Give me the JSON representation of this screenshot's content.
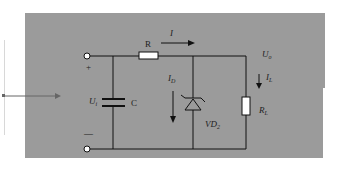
{
  "diagram": {
    "background_color": "#9a9a9a",
    "labels": {
      "resistor": "R",
      "current_main": "I",
      "output_voltage": "U",
      "output_voltage_sub": "o",
      "load_current": "I",
      "load_current_sub": "L",
      "input_voltage": "U",
      "input_voltage_sub": "i",
      "capacitor": "C",
      "zener_current": "I",
      "zener_current_sub": "D",
      "zener_diode": "VD",
      "zener_diode_sub": "2",
      "load_resistor": "R",
      "load_resistor_sub": "L",
      "plus": "+",
      "minus": "—"
    }
  }
}
